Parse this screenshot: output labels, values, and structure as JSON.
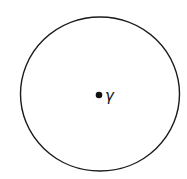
{
  "diagram": {
    "circle": {
      "cx": 100,
      "cy": 94,
      "rx": 79.5,
      "ry": 77,
      "stroke": "#1a1a1a",
      "fill": "#ffffff"
    },
    "point": {
      "cx": 99,
      "cy": 95,
      "r": 3.3,
      "color": "#111111"
    },
    "point_label": "γ"
  }
}
